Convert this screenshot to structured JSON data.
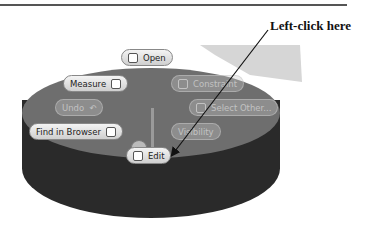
{
  "callout": {
    "text": "Left-click here"
  },
  "marking_menu": {
    "items": [
      {
        "id": "open",
        "label": "Open",
        "icon": "open-icon",
        "enabled": true
      },
      {
        "id": "measure",
        "label": "Measure",
        "icon": "measure-icon",
        "enabled": true
      },
      {
        "id": "constraint",
        "label": "Constraint",
        "icon": "constraint-icon",
        "enabled": false
      },
      {
        "id": "undo",
        "label": "Undo",
        "icon": "undo-icon",
        "enabled": false
      },
      {
        "id": "select_other",
        "label": "Select Other...",
        "icon": "select-other-icon",
        "enabled": false
      },
      {
        "id": "find_in_browser",
        "label": "Find in Browser",
        "icon": "find-in-browser-icon",
        "enabled": true
      },
      {
        "id": "visibility",
        "label": "Visibility",
        "icon": "",
        "enabled": false
      },
      {
        "id": "edit",
        "label": "Edit",
        "icon": "edit-icon",
        "enabled": true
      }
    ]
  }
}
